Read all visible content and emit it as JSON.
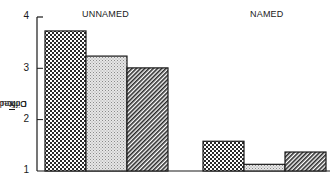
{
  "chart_data": {
    "type": "bar",
    "title": "",
    "xlabel": "",
    "ylabel": "Difficult X̄ Correct",
    "ylabel_parts": {
      "before": "Difficult ",
      "xbar": "X",
      "after": " Correct"
    },
    "ylim": [
      1,
      4
    ],
    "yticks": [
      "1",
      "2",
      "3",
      "4"
    ],
    "grid": false,
    "legend": null,
    "groups": [
      "UNNAMED",
      "NAMED"
    ],
    "series": [
      {
        "name": "Condition 1 (cross-hatched)",
        "pattern": "crosshatch",
        "values": [
          3.73,
          1.58
        ]
      },
      {
        "name": "Condition 2 (stippled)",
        "pattern": "stipple",
        "values": [
          3.24,
          1.13
        ]
      },
      {
        "name": "Condition 3 (diagonal lines)",
        "pattern": "diagonal",
        "values": [
          3.01,
          1.37
        ]
      }
    ]
  },
  "labels": {
    "group1": "UNNAMED",
    "group2": "NAMED",
    "tick1": "1",
    "tick2": "2",
    "tick3": "3",
    "tick4": "4",
    "ylabel_before": "Difficult ",
    "ylabel_xbar": "X",
    "ylabel_after": " Correct"
  },
  "colors": {
    "ink": "#1a1a1a",
    "background": "#ffffff",
    "stipple_fill": "#d8d8d8"
  }
}
